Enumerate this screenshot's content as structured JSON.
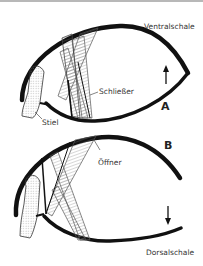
{
  "labels": {
    "ventral": "Ventralschale",
    "dorsal": "Dorsalschale",
    "closer": "Schließer",
    "opener": "Öffner",
    "stalk": "Stiel",
    "panel_a": "A",
    "panel_b": "B"
  },
  "arrows": {
    "panel_a": "up",
    "panel_b": "down"
  },
  "colors": {
    "shell": "#111111",
    "muscle": "#555555",
    "text": "#333333"
  }
}
